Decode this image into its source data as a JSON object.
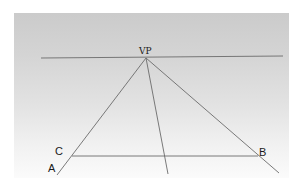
{
  "diagram": {
    "labels": {
      "vp": "VP",
      "a": "A",
      "b": "B",
      "c": "C"
    },
    "colors": {
      "line": "#6b6b6b",
      "text": "#1a1a1a",
      "panel_top": "#cbcbcb",
      "panel_bottom": "#fbfbfb"
    },
    "geometry": {
      "horizon": {
        "x1": 41,
        "y1": 58,
        "x2": 283,
        "y2": 56
      },
      "vanishing_point": {
        "x": 146,
        "y": 58
      },
      "orthogonals": [
        {
          "name": "to-A",
          "x2": 57,
          "y2": 175
        },
        {
          "name": "middle",
          "x2": 168,
          "y2": 174
        },
        {
          "name": "to-B",
          "x2": 279,
          "y2": 173
        }
      ],
      "transversal_CB": {
        "x1": 72,
        "y1": 156,
        "x2": 258,
        "y2": 156
      }
    }
  }
}
